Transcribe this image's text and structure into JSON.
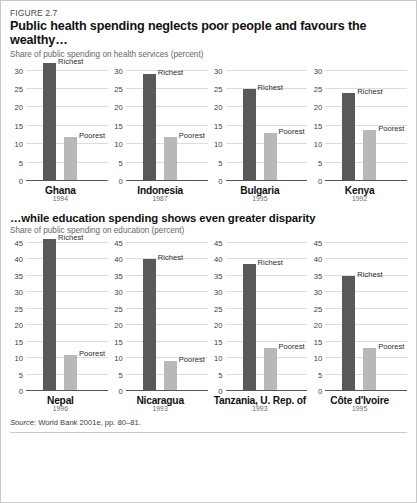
{
  "figure": {
    "label": "FIGURE 2.7",
    "title": "Public health spending neglects poor people and favours the wealthy…",
    "subtitle": "Share of public spending on health services (percent)",
    "section2_title": "…while education spending shows even greater disparity",
    "section2_subtitle": "Share of public spending on education (percent)",
    "source_prefix": "Source:",
    "source_text": "World Bank 2001e, pp. 80–81."
  },
  "legend": {
    "richest": "Richest",
    "poorest": "Poorest"
  },
  "colors": {
    "richest_bar": "#595959",
    "poorest_bar": "#b8b8b8",
    "gridline": "#dcdcdc",
    "axis": "#6e6e6e",
    "border": "#c9c9c9"
  },
  "chart_data": [
    {
      "type": "bar",
      "title": "Public health spending neglects poor people and favours the wealthy…",
      "ylabel": "Share of public spending on health services (percent)",
      "xlabel": "",
      "ylim": [
        0,
        32
      ],
      "yticks": [
        0,
        5,
        10,
        15,
        20,
        25,
        30
      ],
      "grid": true,
      "legend_position": "inline-labels",
      "categories": [
        "Ghana",
        "Indonesia",
        "Bulgaria",
        "Kenya"
      ],
      "series": [
        {
          "name": "Richest",
          "values": [
            32,
            29,
            25,
            24
          ]
        },
        {
          "name": "Poorest",
          "values": [
            12,
            12,
            13,
            14
          ]
        }
      ],
      "panels": [
        {
          "country": "Ghana",
          "year": "1994",
          "richest": 32,
          "poorest": 12
        },
        {
          "country": "Indonesia",
          "year": "1987",
          "richest": 29,
          "poorest": 12
        },
        {
          "country": "Bulgaria",
          "year": "1995",
          "richest": 25,
          "poorest": 13
        },
        {
          "country": "Kenya",
          "year": "1992",
          "richest": 24,
          "poorest": 14
        }
      ]
    },
    {
      "type": "bar",
      "title": "…while education spending shows even greater disparity",
      "ylabel": "Share of public spending on education (percent)",
      "xlabel": "",
      "ylim": [
        0,
        46
      ],
      "yticks": [
        0,
        5,
        10,
        15,
        20,
        25,
        30,
        35,
        40,
        45
      ],
      "grid": true,
      "legend_position": "inline-labels",
      "categories": [
        "Nepal",
        "Nicaragua",
        "Tanzania, U. Rep. of",
        "Côte d'Ivoire"
      ],
      "series": [
        {
          "name": "Richest",
          "values": [
            46,
            40,
            38.5,
            35
          ]
        },
        {
          "name": "Poorest",
          "values": [
            11,
            9,
            13,
            13
          ]
        }
      ],
      "panels": [
        {
          "country": "Nepal",
          "year": "1996",
          "richest": 46,
          "poorest": 11
        },
        {
          "country": "Nicaragua",
          "year": "1993",
          "richest": 40,
          "poorest": 9
        },
        {
          "country": "Tanzania, U. Rep. of",
          "year": "1993",
          "richest": 38.5,
          "poorest": 13
        },
        {
          "country": "Côte d'Ivoire",
          "year": "1995",
          "richest": 35,
          "poorest": 13
        }
      ]
    }
  ]
}
